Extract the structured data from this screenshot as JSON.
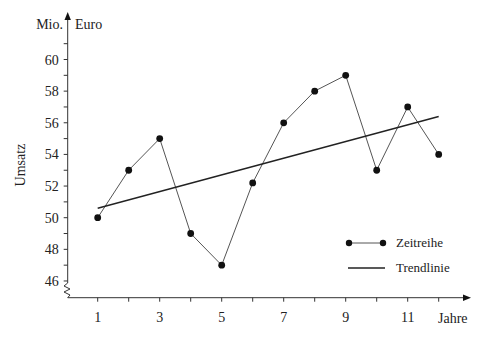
{
  "chart_data": {
    "type": "line",
    "title": "",
    "xlabel": "Jahre",
    "ylabel": "Umsatz",
    "yunit_left": "Mio.",
    "yunit_right": "Euro",
    "x": [
      1,
      2,
      3,
      4,
      5,
      6,
      7,
      8,
      9,
      10,
      11,
      12
    ],
    "x_tick_labels": [
      "1",
      "3",
      "5",
      "7",
      "9",
      "11"
    ],
    "x_tick_label_values": [
      1,
      3,
      5,
      7,
      9,
      11
    ],
    "xlim": [
      0,
      12.5
    ],
    "ylim": [
      46,
      61
    ],
    "y_tick_labels": [
      "46",
      "48",
      "50",
      "52",
      "54",
      "56",
      "58",
      "60"
    ],
    "y_tick_label_values": [
      46,
      48,
      50,
      52,
      54,
      56,
      58,
      60
    ],
    "y_axis_break": true,
    "grid": false,
    "series": [
      {
        "name": "Zeitreihe",
        "style": "line-with-markers",
        "color": "#111111",
        "values": [
          50,
          53,
          55,
          49,
          47,
          52.2,
          56,
          58,
          59,
          53,
          57,
          54
        ]
      },
      {
        "name": "Trendlinie",
        "style": "line",
        "color": "#222222",
        "x": [
          1,
          12
        ],
        "values": [
          50.6,
          56.4
        ]
      }
    ],
    "legend": {
      "position": "lower-right",
      "entries": [
        "Zeitreihe",
        "Trendlinie"
      ]
    }
  }
}
